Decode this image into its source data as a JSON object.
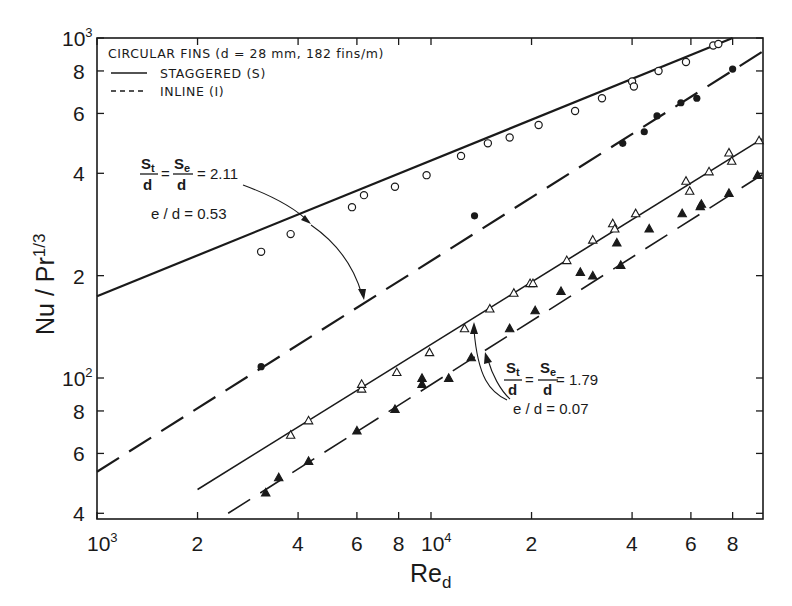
{
  "figure": {
    "legend": {
      "title": "CIRCULAR FINS (d = 28 mm, 182 fins/m)",
      "entries": [
        {
          "style": "solid",
          "label": "STAGGERED (S)"
        },
        {
          "style": "dashed",
          "label": "INLINE (I)"
        }
      ]
    },
    "annotations": [
      {
        "id": "upper",
        "ratio_lhs": "St/d = Se/d = 2.11",
        "st": "S",
        "st_sub": "t",
        "se": "S",
        "se_sub": "e",
        "den": "d",
        "value": "= 2.11",
        "eod": "e / d = 0.53"
      },
      {
        "id": "lower",
        "ratio_lhs": "St/d = Se/d = 1.79",
        "st": "S",
        "st_sub": "t",
        "se": "S",
        "se_sub": "e",
        "den": "d",
        "value": "= 1.79",
        "eod": "e / d = 0.07"
      }
    ],
    "x_axis": {
      "title": "Re",
      "title_sub": "d"
    },
    "y_axis": {
      "title": "Nu / Pr",
      "title_sup": "1/3"
    }
  },
  "chart_data": {
    "type": "scatter",
    "title": "",
    "xlabel": "Re_d",
    "ylabel": "Nu / Pr^(1/3)",
    "xscale": "log",
    "yscale": "log",
    "xlim": [
      1000,
      100000
    ],
    "ylim": [
      40,
      1000
    ],
    "grid": false,
    "legend_position": "upper left",
    "x_ticks": [
      {
        "value": 1000,
        "label": "10",
        "sup": "3"
      },
      {
        "value": 2000,
        "label": "2"
      },
      {
        "value": 4000,
        "label": "4"
      },
      {
        "value": 6000,
        "label": "6"
      },
      {
        "value": 8000,
        "label": "8"
      },
      {
        "value": 10000,
        "label": "10",
        "sup": "4"
      },
      {
        "value": 20000,
        "label": "2"
      },
      {
        "value": 40000,
        "label": "4"
      },
      {
        "value": 60000,
        "label": "6"
      },
      {
        "value": 80000,
        "label": "8"
      }
    ],
    "y_ticks": [
      {
        "value": 40,
        "label": "4"
      },
      {
        "value": 60,
        "label": "6"
      },
      {
        "value": 80,
        "label": "8"
      },
      {
        "value": 100,
        "label": "10",
        "sup": "2"
      },
      {
        "value": 200,
        "label": "2"
      },
      {
        "value": 400,
        "label": "4"
      },
      {
        "value": 600,
        "label": "6"
      },
      {
        "value": 800,
        "label": "8"
      },
      {
        "value": 1000,
        "label": "10",
        "sup": "3"
      }
    ],
    "series": [
      {
        "name": "Staggered (S), St/d = Se/d = 2.11, e/d = 0.53",
        "line_style": "solid",
        "marker": "open-circle",
        "line_width": 2.2,
        "fit": [
          [
            1000,
            174
          ],
          [
            80000,
            1000
          ]
        ],
        "points": [
          [
            3100,
            235
          ],
          [
            3800,
            265
          ],
          [
            5800,
            318
          ],
          [
            6300,
            345
          ],
          [
            7800,
            365
          ],
          [
            9700,
            395
          ],
          [
            12300,
            450
          ],
          [
            14800,
            490
          ],
          [
            17200,
            510
          ],
          [
            21000,
            555
          ],
          [
            27000,
            610
          ],
          [
            32500,
            665
          ],
          [
            40000,
            745
          ],
          [
            40500,
            720
          ],
          [
            48000,
            800
          ],
          [
            58000,
            850
          ],
          [
            70000,
            950
          ],
          [
            72500,
            960
          ]
        ]
      },
      {
        "name": "Inline (I), St/d = Se/d = 2.11, e/d = 0.53",
        "line_style": "dashed",
        "marker": "filled-circle",
        "line_width": 2.2,
        "fit": [
          [
            1000,
            53
          ],
          [
            98000,
            910
          ]
        ],
        "points": [
          [
            3100,
            108
          ],
          [
            13500,
            300
          ],
          [
            37500,
            490
          ],
          [
            43500,
            530
          ],
          [
            47500,
            590
          ],
          [
            56000,
            645
          ],
          [
            62500,
            665
          ],
          [
            80000,
            810
          ]
        ]
      },
      {
        "name": "Staggered (S), St/d = Se/d = 1.79, e/d = 0.07",
        "line_style": "solid",
        "marker": "open-triangle",
        "line_width": 1.6,
        "fit": [
          [
            2000,
            47
          ],
          [
            98000,
            505
          ]
        ],
        "points": [
          [
            3800,
            68
          ],
          [
            4300,
            75
          ],
          [
            6200,
            93
          ],
          [
            6200,
            96
          ],
          [
            7900,
            104
          ],
          [
            9900,
            119
          ],
          [
            12600,
            140
          ],
          [
            15000,
            160
          ],
          [
            17700,
            178
          ],
          [
            19800,
            190
          ],
          [
            20200,
            190
          ],
          [
            25500,
            222
          ],
          [
            30500,
            255
          ],
          [
            35000,
            285
          ],
          [
            35500,
            275
          ],
          [
            41000,
            305
          ],
          [
            58000,
            380
          ],
          [
            59500,
            355
          ],
          [
            68000,
            405
          ],
          [
            78000,
            460
          ],
          [
            79500,
            435
          ],
          [
            96000,
            500
          ]
        ]
      },
      {
        "name": "Inline (I), St/d = Se/d = 1.79, e/d = 0.07",
        "line_style": "dashed",
        "marker": "filled-triangle",
        "line_width": 1.6,
        "fit": [
          [
            2470,
            40
          ],
          [
            98000,
            396
          ]
        ],
        "points": [
          [
            3200,
            46
          ],
          [
            3500,
            51
          ],
          [
            4300,
            57
          ],
          [
            6000,
            70
          ],
          [
            7800,
            81
          ],
          [
            9400,
            100
          ],
          [
            9400,
            96
          ],
          [
            11300,
            100
          ],
          [
            13200,
            115
          ],
          [
            17200,
            140
          ],
          [
            20500,
            158
          ],
          [
            24500,
            180
          ],
          [
            28000,
            205
          ],
          [
            30500,
            200
          ],
          [
            37000,
            215
          ],
          [
            36000,
            250
          ],
          [
            45000,
            275
          ],
          [
            56500,
            305
          ],
          [
            64000,
            320
          ],
          [
            64500,
            325
          ],
          [
            78000,
            350
          ],
          [
            95000,
            395
          ]
        ]
      }
    ]
  }
}
